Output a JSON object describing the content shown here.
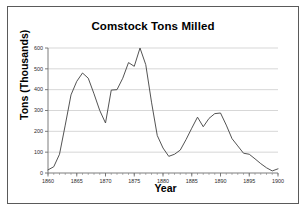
{
  "chart_data": {
    "type": "line",
    "title": "Comstock Tons Milled",
    "xlabel": "Year",
    "ylabel": "Tons (Thousands)",
    "xlim": [
      1860,
      1900
    ],
    "ylim": [
      0,
      600
    ],
    "grid": true,
    "legend": "none",
    "xticks": [
      1860,
      1865,
      1870,
      1875,
      1880,
      1885,
      1890,
      1895,
      1900
    ],
    "yticks": [
      0,
      100,
      200,
      300,
      400,
      500,
      600
    ],
    "minor_xtick_interval": 1,
    "line_color": "#4a4a4a",
    "x": [
      1860,
      1861,
      1862,
      1863,
      1864,
      1865,
      1866,
      1867,
      1868,
      1869,
      1870,
      1871,
      1872,
      1873,
      1874,
      1875,
      1876,
      1877,
      1878,
      1879,
      1880,
      1881,
      1882,
      1883,
      1884,
      1885,
      1886,
      1887,
      1888,
      1889,
      1890,
      1891,
      1892,
      1893,
      1894,
      1895,
      1896,
      1897,
      1898,
      1899,
      1900
    ],
    "values": [
      15,
      30,
      90,
      230,
      375,
      440,
      480,
      455,
      380,
      300,
      240,
      398,
      400,
      455,
      530,
      512,
      600,
      520,
      340,
      180,
      120,
      80,
      90,
      110,
      160,
      215,
      268,
      222,
      262,
      285,
      288,
      230,
      165,
      130,
      95,
      90,
      68,
      45,
      25,
      10,
      20
    ]
  },
  "axis_titles": {
    "y": "Tons (Thousands)",
    "x": "Year"
  }
}
